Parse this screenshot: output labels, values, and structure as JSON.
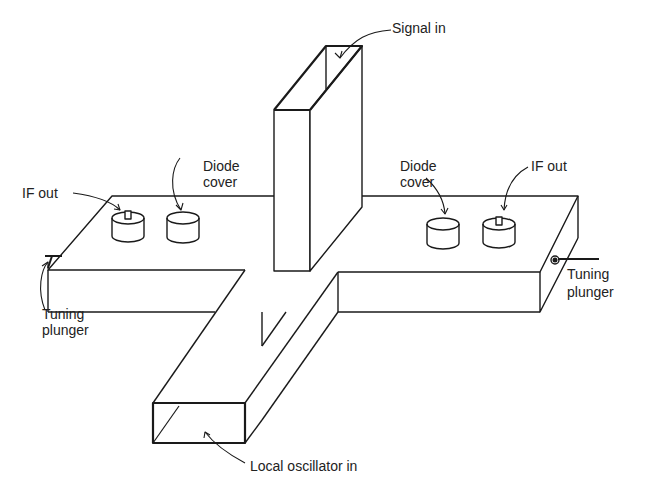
{
  "diagram": {
    "type": "isometric waveguide balanced mixer",
    "labels": {
      "signal_in": "Signal in",
      "diode_cover_left_1": "Diode",
      "diode_cover_left_2": "cover",
      "diode_cover_right_1": "Diode",
      "diode_cover_right_2": "cover",
      "if_out_left": "IF out",
      "if_out_right": "IF out",
      "tuning_plunger_left_1": "Tuning",
      "tuning_plunger_left_2": "plunger",
      "tuning_plunger_right_1": "Tuning",
      "tuning_plunger_right_2": "plunger",
      "local_oscillator_in": "Local oscillator in"
    },
    "colors": {
      "line": "#1a1a1a",
      "background": "#ffffff"
    }
  }
}
